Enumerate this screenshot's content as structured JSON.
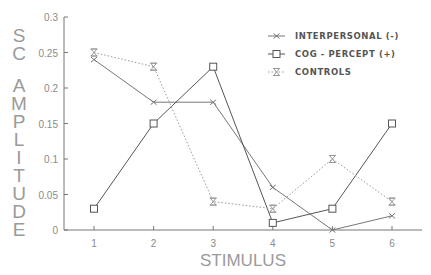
{
  "chart_data": {
    "type": "line",
    "title": "",
    "xlabel": "STIMULUS",
    "ylabel": "SC AMPLITUDE",
    "x": [
      1,
      2,
      3,
      4,
      5,
      6
    ],
    "x_tick_labels": [
      "1",
      "2",
      "3",
      "4",
      "5",
      "6"
    ],
    "xlim": [
      0.5,
      6.5
    ],
    "ylim": [
      0,
      0.3
    ],
    "y_ticks": [
      0,
      0.05,
      0.1,
      0.15,
      0.2,
      0.25,
      0.3
    ],
    "y_tick_labels": [
      "0",
      "0.05",
      "0.1",
      "0.15",
      "0.2",
      "0.25",
      "0.3"
    ],
    "grid": false,
    "legend_position": "top-right",
    "series": [
      {
        "name": "INTERPERSONAL (-)",
        "marker": "x",
        "line_style": "solid",
        "color": "#777777",
        "values": [
          0.24,
          0.18,
          0.18,
          0.06,
          0.0,
          0.02
        ]
      },
      {
        "name": "COG - PERCEPT (+)",
        "marker": "square",
        "line_style": "solid",
        "color": "#555555",
        "values": [
          0.03,
          0.15,
          0.23,
          0.01,
          0.03,
          0.15
        ]
      },
      {
        "name": "CONTROLS",
        "marker": "hourglass",
        "line_style": "dotted",
        "color": "#999999",
        "values": [
          0.25,
          0.23,
          0.04,
          0.03,
          0.1,
          0.04
        ]
      }
    ]
  }
}
